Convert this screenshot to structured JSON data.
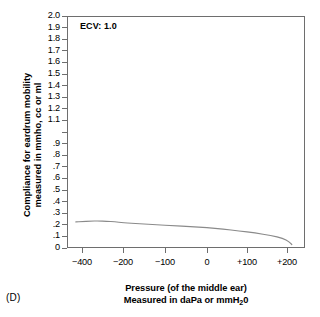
{
  "panel": {
    "letter": "(D)"
  },
  "annotation": {
    "ecv": "ECV: 1.0"
  },
  "axis_titles": {
    "y_line1": "Compliance for eardrum mobility",
    "y_line2": "measured in mmho, cc or ml",
    "x_line1": "Pressure (of the middle ear)",
    "x_line2_pre": "Measured in daPa or mmH",
    "x_line2_sub": "2",
    "x_line2_post": "0"
  },
  "colors": {
    "axis": "#6e6e6e",
    "curve": "#8a8a8a",
    "text": "#000000",
    "background": "#ffffff"
  },
  "chart_data": {
    "type": "line",
    "title": "",
    "subtitle": "",
    "xlabel": "Pressure (of the middle ear) Measured in daPa or mmH20",
    "ylabel": "Compliance for eardrum mobility measured in mmho, cc or ml",
    "annotations": [
      "ECV: 1.0",
      "(D)"
    ],
    "grid": false,
    "legend": "none",
    "tympanogram_type": "B (flat)",
    "xlim": [
      -500,
      250
    ],
    "ylim": [
      0,
      2.0
    ],
    "x_tick_labels": [
      "−400",
      "−200",
      "−100",
      "0",
      "+100",
      "+200"
    ],
    "x_tick_values": [
      -400,
      -200,
      -100,
      0,
      100,
      200
    ],
    "x_tick_positions_px": [
      82,
      123,
      165,
      207,
      247,
      287
    ],
    "y_tick_labels": [
      "2.0",
      "1.9",
      "1.8",
      "1.7",
      "1.6",
      "1.5",
      "1.4",
      "1.3",
      "1.2",
      "1.1",
      "",
      ".9",
      ".8",
      ".7",
      ".6",
      ".5",
      ".4",
      ".3",
      ".2",
      ".1",
      "0"
    ],
    "y_tick_values": [
      2.0,
      1.9,
      1.8,
      1.7,
      1.6,
      1.5,
      1.4,
      1.3,
      1.2,
      1.1,
      1.0,
      0.9,
      0.8,
      0.7,
      0.6,
      0.5,
      0.4,
      0.3,
      0.2,
      0.1,
      0.0
    ],
    "series": [
      {
        "name": "Tympanogram (flat / Type B)",
        "x": [
          -430,
          -400,
          -360,
          -320,
          -280,
          -240,
          -200,
          -160,
          -120,
          -80,
          -40,
          0,
          40,
          80,
          120,
          160,
          190,
          205,
          212
        ],
        "values": [
          0.225,
          0.228,
          0.232,
          0.233,
          0.231,
          0.226,
          0.218,
          0.209,
          0.2,
          0.192,
          0.185,
          0.175,
          0.163,
          0.148,
          0.13,
          0.108,
          0.083,
          0.055,
          0.03
        ]
      }
    ]
  }
}
